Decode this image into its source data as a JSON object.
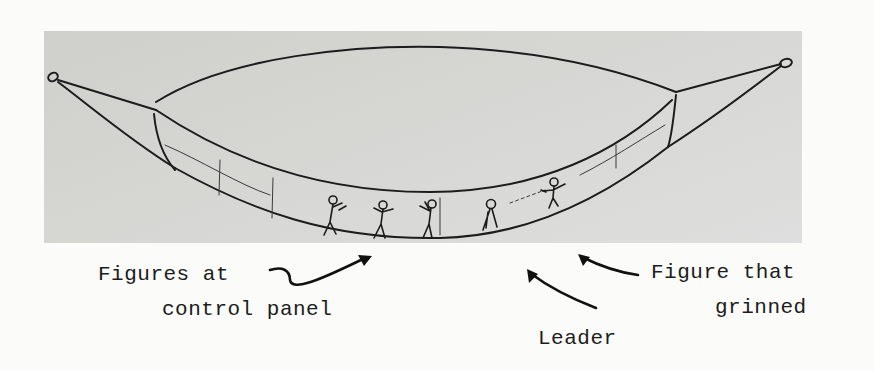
{
  "figure": {
    "colors": {
      "panel": "#d4d4d1",
      "ink": "#1c1c1c",
      "paper": "#fbfbf9"
    }
  },
  "labels": {
    "figures_at_control_panel": {
      "line1": "Figures at",
      "line2": "control panel"
    },
    "leader": "Leader",
    "figure_that_grinned": {
      "line1": "Figure that",
      "line2": "grinned"
    }
  }
}
